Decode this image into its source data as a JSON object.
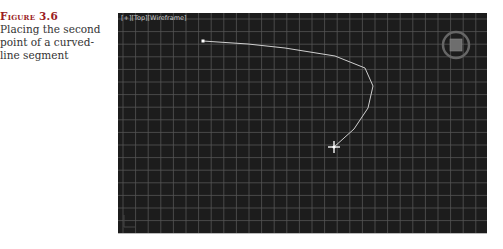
{
  "caption": {
    "label": "Figure 3.6",
    "text": "Placing the second point of a curved-line segment"
  },
  "viewport": {
    "label": "[+][Top][Wireframe]",
    "background": "#1c1c1c",
    "grid_color": "#555555",
    "grid_spacing_px": 12.6,
    "curve_color": "#cfcfcf",
    "curve_points": [
      [
        85,
        28
      ],
      [
        130,
        31
      ],
      [
        167,
        35
      ],
      [
        217,
        43
      ],
      [
        247,
        55
      ],
      [
        255,
        73
      ],
      [
        250,
        95
      ],
      [
        236,
        116
      ],
      [
        216,
        134
      ]
    ],
    "start_vertex": [
      85,
      28
    ],
    "cursor": [
      216,
      134
    ],
    "viewcube": "view-cube"
  }
}
